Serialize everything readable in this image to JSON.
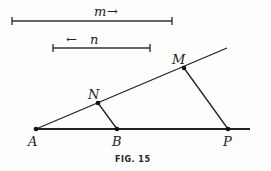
{
  "figure": {
    "caption": "FIG. 15",
    "segments": {
      "m": {
        "label": "m",
        "arrow": "→"
      },
      "n": {
        "label": "n",
        "arrow": "←"
      }
    },
    "points": {
      "A": "A",
      "B": "B",
      "P": "P",
      "N": "N",
      "M": "M"
    }
  }
}
